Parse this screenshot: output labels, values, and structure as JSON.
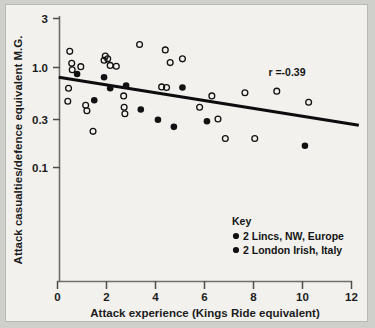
{
  "chart_data": {
    "type": "scatter",
    "title": "",
    "xlabel": "Attack experience (Kings Ride equivalent)",
    "ylabel": "Attack casualties/defence equivalent M.G.",
    "xlim": [
      0,
      12.4
    ],
    "ylim": [
      0.07,
      3.2
    ],
    "yscale": "log",
    "xticks": [
      0,
      2,
      4,
      6,
      8,
      10,
      12
    ],
    "xticklabels": [
      "0",
      "2",
      "4",
      "6",
      "8",
      "10",
      "12"
    ],
    "yticks": [
      0.1,
      0.3,
      1.0,
      3
    ],
    "yticklabels": [
      "0.1",
      "0.3",
      "1.0",
      "3"
    ],
    "grid": false,
    "annotation": "r =-0.39",
    "legend_title": "Key",
    "legend_position": "lower-right-inside",
    "series": [
      {
        "name": "2 Lincs, NW, Europe",
        "marker": "open-circle",
        "color": "#111111",
        "points": [
          [
            0.45,
            0.62
          ],
          [
            0.5,
            1.45
          ],
          [
            0.58,
            1.1
          ],
          [
            0.6,
            0.95
          ],
          [
            0.42,
            0.46
          ],
          [
            0.95,
            1.02
          ],
          [
            1.15,
            0.42
          ],
          [
            1.2,
            0.37
          ],
          [
            1.45,
            0.23
          ],
          [
            1.9,
            1.18
          ],
          [
            1.95,
            1.3
          ],
          [
            2.05,
            1.22
          ],
          [
            2.15,
            1.05
          ],
          [
            2.4,
            1.03
          ],
          [
            2.7,
            0.52
          ],
          [
            2.72,
            0.4
          ],
          [
            2.75,
            0.345
          ],
          [
            3.35,
            1.7
          ],
          [
            4.25,
            0.64
          ],
          [
            4.45,
            0.63
          ],
          [
            4.4,
            1.5
          ],
          [
            4.6,
            1.12
          ],
          [
            5.1,
            1.22
          ],
          [
            5.8,
            0.4
          ],
          [
            6.3,
            0.52
          ],
          [
            6.55,
            0.305
          ],
          [
            6.85,
            0.195
          ],
          [
            7.65,
            0.56
          ],
          [
            8.05,
            0.195
          ],
          [
            8.95,
            0.58
          ],
          [
            10.25,
            0.45
          ]
        ]
      },
      {
        "name": "2 London Irish, Italy",
        "marker": "filled-circle",
        "color": "#111111",
        "points": [
          [
            0.8,
            0.86
          ],
          [
            1.5,
            0.47
          ],
          [
            1.9,
            0.8
          ],
          [
            2.15,
            0.62
          ],
          [
            2.8,
            0.66
          ],
          [
            3.4,
            0.38
          ],
          [
            4.1,
            0.3
          ],
          [
            4.75,
            0.255
          ],
          [
            5.1,
            0.63
          ],
          [
            6.1,
            0.29
          ],
          [
            10.1,
            0.165
          ]
        ]
      }
    ],
    "trendline": {
      "x_start": 0.05,
      "y_start": 0.8,
      "x_end": 12.3,
      "y_end": 0.265
    }
  },
  "legend": {
    "title": "Key",
    "entries": [
      {
        "marker": "filled-circle",
        "label": "2 Lincs, NW, Europe"
      },
      {
        "marker": "filled-circle",
        "label": "2 London Irish, Italy"
      }
    ]
  },
  "colors": {
    "background": "#cfcfcb",
    "plate": "#f2f1ee",
    "ink": "#141414"
  }
}
